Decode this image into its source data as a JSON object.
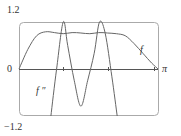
{
  "chart_data": {
    "type": "line",
    "title": "",
    "xlabel": "",
    "ylabel": "",
    "xlim": [
      0,
      3.1416
    ],
    "ylim": [
      -1.2,
      1.2
    ],
    "x_ticks": [
      "0",
      "π"
    ],
    "y_ticks": [
      "1.2",
      "0",
      "-1.2"
    ],
    "grid": false,
    "legend": "inline labels",
    "series": [
      {
        "name": "f",
        "x": [
          0,
          0.2,
          0.4,
          0.6,
          0.8,
          1.0,
          1.2,
          1.4,
          1.6,
          1.8,
          2.0,
          2.2,
          2.4,
          2.6,
          2.8,
          3.0,
          3.1416
        ],
        "y": [
          0,
          0.5,
          0.85,
          0.95,
          0.93,
          0.9,
          0.93,
          0.92,
          0.9,
          0.93,
          0.92,
          0.9,
          0.85,
          0.65,
          0.4,
          0.15,
          0
        ]
      },
      {
        "name": "f''",
        "x": [
          0.72,
          0.85,
          1.0,
          1.1,
          1.25,
          1.4,
          1.55,
          1.7,
          1.82,
          1.95,
          2.1,
          2.22
        ],
        "y": [
          -1.2,
          0.0,
          1.2,
          0.6,
          -0.3,
          -0.95,
          -0.3,
          0.4,
          1.2,
          0.9,
          -0.2,
          -1.2
        ]
      }
    ]
  },
  "labels": {
    "y_top": "1.2",
    "y_zero": "0",
    "y_bottom": "−1.2",
    "x_end": "π",
    "f": "f",
    "f2": "f ″"
  }
}
